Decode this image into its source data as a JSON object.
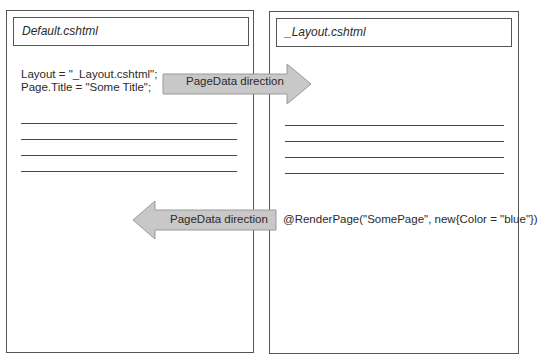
{
  "diagram": {
    "left_panel": {
      "title": "Default.cshtml",
      "code_lines": [
        "Layout = \"_Layout.cshtml\";",
        "Page.Title = \"Some Title\";"
      ],
      "rule_count": 4
    },
    "right_panel": {
      "title": "_Layout.cshtml",
      "code_lines": [
        "@RenderPage(\"SomePage\", new{Color = \"blue\"})"
      ],
      "rule_count": 4
    },
    "arrows": [
      {
        "label": "PageData direction",
        "direction": "right",
        "from": "Default.cshtml",
        "to": "_Layout.cshtml"
      },
      {
        "label": "PageData direction",
        "direction": "left",
        "from": "_Layout.cshtml",
        "to": "Default.cshtml"
      }
    ],
    "colors": {
      "arrow_fill": "#c8c8c8",
      "arrow_stroke": "#9a9a9a",
      "border": "#555555",
      "text": "#2a2a2a"
    }
  }
}
